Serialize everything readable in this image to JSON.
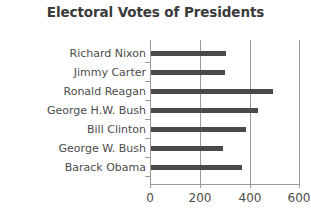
{
  "chart_data": {
    "type": "bar",
    "orientation": "horizontal",
    "title": "Electoral Votes of Presidents",
    "xlabel": "",
    "ylabel": "",
    "categories": [
      "Richard Nixon",
      "Jimmy Carter",
      "Ronald Reagan",
      "George H.W. Bush",
      "Bill Clinton",
      "George W. Bush",
      "Barack Obama"
    ],
    "values": [
      301,
      297,
      489,
      426,
      379,
      286,
      365
    ],
    "xlim": [
      0,
      600
    ],
    "xticks": [
      0,
      200,
      400,
      600
    ],
    "xtick_labels": [
      "0",
      "200",
      "400",
      "600"
    ],
    "grid": "vertical",
    "legend": "none",
    "bar_color": "#4a4a4a",
    "axis_color": "#9a9a9a",
    "title_color": "#3a3a3a",
    "label_color": "#4c4c4c",
    "background": "#ffffff"
  }
}
